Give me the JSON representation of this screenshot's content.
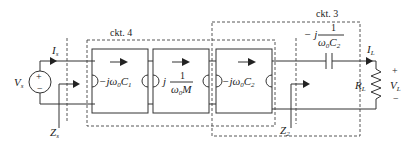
{
  "diagram": {
    "type": "circuit",
    "source": {
      "voltage_label": "V",
      "voltage_sub": "s",
      "current_label": "I",
      "current_sub": "s",
      "plus": "+",
      "minus": "−"
    },
    "impedance_labels": {
      "zs": {
        "main": "Z",
        "sub": "s"
      },
      "z2": {
        "main": "Z",
        "sub": "2"
      }
    },
    "subcircuits": [
      {
        "id": "ckt4",
        "label": "ckt. 4"
      },
      {
        "id": "ckt3",
        "label": "ckt. 3"
      }
    ],
    "blocks": [
      {
        "id": "block1",
        "prefix": "−jω",
        "omega_sub": "0",
        "sym": "C",
        "sym_sub": "1"
      },
      {
        "id": "block2",
        "prefix": "j",
        "numerator": "1",
        "denominator": "ω",
        "omega_sub": "0",
        "den_sym": "M"
      },
      {
        "id": "block3",
        "prefix": "−jω",
        "omega_sub": "0",
        "sym": "C",
        "sym_sub": "2"
      }
    ],
    "series_capacitor": {
      "prefix": "− j",
      "numerator": "1",
      "denominator": "ω",
      "omega_sub": "0",
      "den_sym": "C",
      "den_sub": "2"
    },
    "load": {
      "resistor_label": "R",
      "resistor_sub": "L",
      "current_label": "I",
      "current_sub": "L",
      "voltage_label": "V",
      "voltage_sub": "L",
      "plus": "+",
      "minus": "−"
    }
  }
}
